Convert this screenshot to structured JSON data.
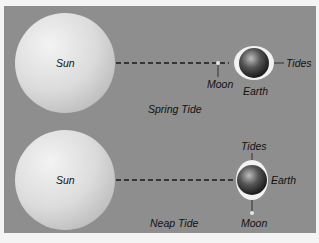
{
  "diagram": {
    "panels": [
      {
        "name": "spring-tide",
        "caption": "Spring Tide",
        "sun_label": "Sun",
        "moon_label": "Moon",
        "earth_label": "Earth",
        "tides_label": "Tides"
      },
      {
        "name": "neap-tide",
        "caption": "Neap Tide",
        "sun_label": "Sun",
        "moon_label": "Moon",
        "earth_label": "Earth",
        "tides_label": "Tides"
      }
    ],
    "colors": {
      "background": "#8e8e8e",
      "sun": "#dedede",
      "earth_dark": "#1c1c1c",
      "tidal_bulge": "#f2f2f2",
      "line": "#1a1a1a"
    }
  }
}
